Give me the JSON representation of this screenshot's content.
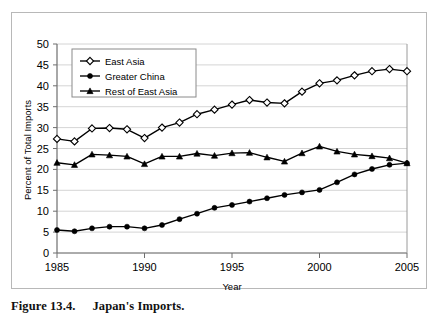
{
  "figure": {
    "caption_label": "Figure 13.4.",
    "caption_text": "Japan's Imports."
  },
  "chart_data": {
    "type": "line",
    "title": "",
    "xlabel": "Year",
    "ylabel": "Percent of Total Imports",
    "xlim": [
      1985,
      2005
    ],
    "ylim": [
      0,
      50
    ],
    "ytick_step": 5,
    "yticks": [
      0,
      5,
      10,
      15,
      20,
      25,
      30,
      35,
      40,
      45,
      50
    ],
    "xticks": [
      1985,
      1990,
      1995,
      2000,
      2005
    ],
    "xtick_labels": [
      "1985",
      "1990",
      "1995",
      "2000",
      "2005"
    ],
    "ytick_labels": [
      "0",
      "5",
      "10",
      "15",
      "20",
      "25",
      "30",
      "35",
      "40",
      "45",
      "50"
    ],
    "grid": "horizontal",
    "legend_position": "top-left-inside",
    "x": [
      1985,
      1986,
      1987,
      1988,
      1989,
      1990,
      1991,
      1992,
      1993,
      1994,
      1995,
      1996,
      1997,
      1998,
      1999,
      2000,
      2001,
      2002,
      2003,
      2004,
      2005
    ],
    "series": [
      {
        "name": "East Asia",
        "marker": "open-diamond",
        "values": [
          27.3,
          26.7,
          29.8,
          29.9,
          29.6,
          27.5,
          30.0,
          31.2,
          33.2,
          34.3,
          35.5,
          36.6,
          36.0,
          35.8,
          38.6,
          40.6,
          41.3,
          42.5,
          43.5,
          44.0,
          43.5
        ]
      },
      {
        "name": "Greater China",
        "marker": "filled-circle",
        "values": [
          5.5,
          5.2,
          5.9,
          6.3,
          6.3,
          5.9,
          6.7,
          8.1,
          9.4,
          10.8,
          11.5,
          12.3,
          13.1,
          13.9,
          14.5,
          15.1,
          16.9,
          18.8,
          20.1,
          21.1,
          21.5
        ]
      },
      {
        "name": "Rest of East Asia",
        "marker": "filled-triangle",
        "values": [
          21.6,
          21.1,
          23.6,
          23.4,
          23.1,
          21.3,
          23.1,
          23.1,
          23.8,
          23.3,
          23.9,
          24.0,
          22.9,
          21.9,
          23.9,
          25.5,
          24.3,
          23.6,
          23.2,
          22.7,
          21.5
        ]
      }
    ]
  }
}
